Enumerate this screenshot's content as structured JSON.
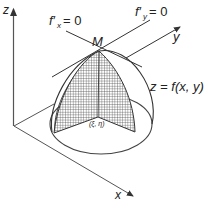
{
  "diagram": {
    "axes": {
      "z_label": "z",
      "y_label": "y",
      "x_label": "x"
    },
    "labels": {
      "fx_condition": "f′x = 0",
      "fx_main": "f′",
      "fx_sub": "x",
      "fy_main": "f′",
      "fy_sub": "y",
      "eq_zero": "= 0",
      "apex": "M",
      "surface": "z = f(x, y)",
      "base_point": "(ξ, η)"
    },
    "colors": {
      "line": "#333333",
      "mesh": "#444444",
      "background": "#ffffff"
    }
  }
}
